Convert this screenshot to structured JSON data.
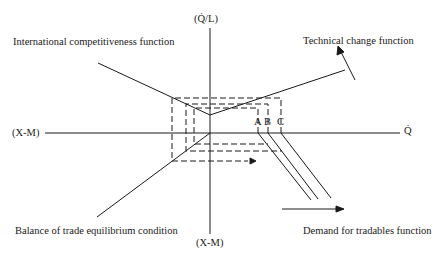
{
  "diagram": {
    "axes": {
      "top": "(Q̇/L)",
      "bottom": "(X-M)",
      "left": "(X-M)",
      "right": "Q̇"
    },
    "labels": {
      "international_competitiveness": "International competitiveness function",
      "technical_change": "Technical change function",
      "balance_of_trade": "Balance of trade equilibrium condition",
      "demand_for_tradables": "Demand for tradables function"
    },
    "points": {
      "a": "A",
      "b": "B",
      "c": "C"
    },
    "colors": {
      "ink": "#1a1a1a",
      "background": "#ffffff"
    }
  }
}
